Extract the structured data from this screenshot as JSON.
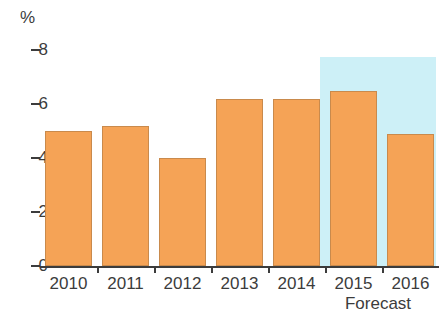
{
  "chart_data": {
    "type": "bar",
    "title": "",
    "subtitle": "",
    "xlabel": "",
    "ylabel": "%",
    "unit_label": "%",
    "categories": [
      "2010",
      "2011",
      "2012",
      "2013",
      "2014",
      "2015",
      "2016"
    ],
    "values": [
      5.0,
      5.2,
      4.0,
      6.2,
      6.2,
      6.5,
      4.9
    ],
    "series": [
      {
        "name": "",
        "values": [
          5.0,
          5.2,
          4.0,
          6.2,
          6.2,
          6.5,
          4.9
        ]
      }
    ],
    "ylim": [
      0,
      8
    ],
    "ytick_labels": [
      "0",
      "2",
      "4",
      "6",
      "8"
    ],
    "ytick_values": [
      0,
      2,
      4,
      6,
      8
    ],
    "grid": false,
    "legend": false,
    "legend_position": "none",
    "annotations": [
      {
        "text": "Forecast",
        "covers_categories": [
          "2015",
          "2016"
        ],
        "style": "shaded-band"
      }
    ],
    "bar_color": "#f5a356",
    "bar_border_color": "#c98a4c",
    "forecast_band_color": "#cdf0f7",
    "axis_color": "#3c3c3c"
  },
  "axis": {
    "unit": "%",
    "ticks": [
      {
        "label": "8",
        "value": 8
      },
      {
        "label": "6",
        "value": 6
      },
      {
        "label": "4",
        "value": 4
      },
      {
        "label": "2",
        "value": 2
      },
      {
        "label": "0",
        "value": 0
      }
    ]
  },
  "categories": [
    {
      "label": "2010",
      "value": 5.0,
      "forecast": false
    },
    {
      "label": "2011",
      "value": 5.2,
      "forecast": false
    },
    {
      "label": "2012",
      "value": 4.0,
      "forecast": false
    },
    {
      "label": "2013",
      "value": 6.2,
      "forecast": false
    },
    {
      "label": "2014",
      "value": 6.2,
      "forecast": false
    },
    {
      "label": "2015",
      "value": 6.5,
      "forecast": true
    },
    {
      "label": "2016",
      "value": 4.9,
      "forecast": true
    }
  ],
  "forecast": {
    "caption": "Forecast"
  }
}
